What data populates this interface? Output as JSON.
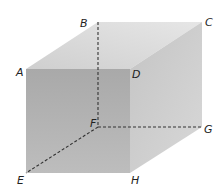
{
  "diagram": {
    "type": "cube",
    "colors": {
      "front_face": "#b3b3b3",
      "top_face": "#d9d9d9",
      "right_face": "#c9c9c9",
      "hidden_edge": "#333333",
      "label": "#222222"
    },
    "vertices": {
      "A": {
        "label": "A",
        "x": 26,
        "y": 69
      },
      "B": {
        "label": "B",
        "x": 98,
        "y": 22
      },
      "C": {
        "label": "C",
        "x": 202,
        "y": 22
      },
      "D": {
        "label": "D",
        "x": 130,
        "y": 69
      },
      "E": {
        "label": "E",
        "x": 26,
        "y": 173
      },
      "F": {
        "label": "F",
        "x": 98,
        "y": 127
      },
      "G": {
        "label": "G",
        "x": 202,
        "y": 127
      },
      "H": {
        "label": "H",
        "x": 130,
        "y": 173
      }
    },
    "faces": [
      {
        "name": "front",
        "vertices": [
          "A",
          "D",
          "H",
          "E"
        ]
      },
      {
        "name": "top",
        "vertices": [
          "A",
          "B",
          "C",
          "D"
        ]
      },
      {
        "name": "right",
        "vertices": [
          "D",
          "C",
          "G",
          "H"
        ]
      }
    ],
    "hidden_edges": [
      [
        "B",
        "F"
      ],
      [
        "F",
        "G"
      ],
      [
        "F",
        "E"
      ]
    ]
  }
}
